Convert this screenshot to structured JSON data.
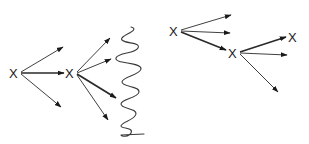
{
  "diagram": {
    "title": "",
    "nodes": [
      {
        "id": "n1",
        "label": "X",
        "group": "left"
      },
      {
        "id": "n2",
        "label": "X",
        "group": "left"
      },
      {
        "id": "n3",
        "label": "X",
        "group": "right"
      },
      {
        "id": "n4",
        "label": "X",
        "group": "right"
      },
      {
        "id": "n5",
        "label": "X",
        "group": "right"
      }
    ],
    "edges": [
      {
        "from": "n1",
        "to": "branch-up",
        "weight": "thin"
      },
      {
        "from": "n1",
        "to": "n2",
        "weight": "bold"
      },
      {
        "from": "n1",
        "to": "branch-down",
        "weight": "thin"
      },
      {
        "from": "n2",
        "to": "branch-1",
        "weight": "thin"
      },
      {
        "from": "n2",
        "to": "branch-2",
        "weight": "thin"
      },
      {
        "from": "n2",
        "to": "branch-3",
        "weight": "bold"
      },
      {
        "from": "n2",
        "to": "branch-4",
        "weight": "thin"
      },
      {
        "from": "n3",
        "to": "branch-up",
        "weight": "thin"
      },
      {
        "from": "n3",
        "to": "branch-mid",
        "weight": "thin"
      },
      {
        "from": "n3",
        "to": "n4",
        "weight": "bold"
      },
      {
        "from": "n4",
        "to": "n5",
        "weight": "bold"
      },
      {
        "from": "n4",
        "to": "branch-mid",
        "weight": "thin"
      },
      {
        "from": "n4",
        "to": "branch-down",
        "weight": "thin"
      }
    ],
    "barrier": {
      "type": "squiggle",
      "description": "wavy boundary line"
    }
  }
}
